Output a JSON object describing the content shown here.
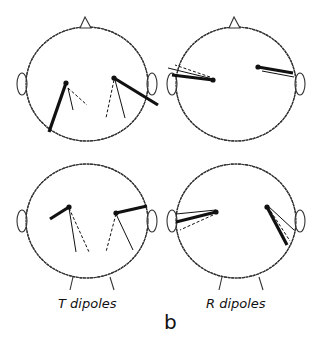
{
  "figure": {
    "panel_letter": "b",
    "columns": [
      {
        "label": "T dipoles"
      },
      {
        "label": "R dipoles"
      }
    ],
    "colors": {
      "ink": "#111111",
      "outline": "#333333"
    },
    "heads": [
      {
        "id": "top-left",
        "cx": 87,
        "cy": 84,
        "rx": 61,
        "ry": 57,
        "nose": true,
        "chin": false,
        "dipoles": [
          {
            "x1": 66,
            "y1": 83,
            "x2": 49,
            "y2": 132,
            "style": "thick"
          },
          {
            "x1": 68,
            "y1": 88,
            "x2": 73,
            "y2": 110,
            "style": "thin"
          },
          {
            "x1": 68,
            "y1": 88,
            "x2": 87,
            "y2": 105,
            "style": "dashed"
          },
          {
            "x1": 114,
            "y1": 78,
            "x2": 158,
            "y2": 105,
            "style": "thick"
          },
          {
            "x1": 115,
            "y1": 80,
            "x2": 125,
            "y2": 118,
            "style": "thin"
          },
          {
            "x1": 114,
            "y1": 80,
            "x2": 106,
            "y2": 118,
            "style": "dashed"
          }
        ]
      },
      {
        "id": "top-right",
        "cx": 236,
        "cy": 84,
        "rx": 60,
        "ry": 57,
        "nose": true,
        "chin": false,
        "dipoles": [
          {
            "x1": 213,
            "y1": 80,
            "x2": 172,
            "y2": 75,
            "style": "thick"
          },
          {
            "x1": 213,
            "y1": 79,
            "x2": 168,
            "y2": 68,
            "style": "thin"
          },
          {
            "x1": 210,
            "y1": 77,
            "x2": 175,
            "y2": 65,
            "style": "dashed"
          },
          {
            "x1": 258,
            "y1": 67,
            "x2": 293,
            "y2": 73,
            "style": "thick"
          },
          {
            "x1": 262,
            "y1": 71,
            "x2": 294,
            "y2": 77,
            "style": "thin"
          }
        ]
      },
      {
        "id": "bottom-left",
        "cx": 87,
        "cy": 221,
        "rx": 61,
        "ry": 57,
        "nose": false,
        "chin": true,
        "dipoles": [
          {
            "x1": 69,
            "y1": 207,
            "x2": 50,
            "y2": 219,
            "style": "thick"
          },
          {
            "x1": 69,
            "y1": 208,
            "x2": 76,
            "y2": 252,
            "style": "thin"
          },
          {
            "x1": 69,
            "y1": 208,
            "x2": 89,
            "y2": 252,
            "style": "dashed"
          },
          {
            "x1": 116,
            "y1": 213,
            "x2": 147,
            "y2": 206,
            "style": "thick"
          },
          {
            "x1": 116,
            "y1": 214,
            "x2": 133,
            "y2": 250,
            "style": "thin"
          },
          {
            "x1": 116,
            "y1": 214,
            "x2": 106,
            "y2": 252,
            "style": "dashed"
          }
        ]
      },
      {
        "id": "bottom-right",
        "cx": 236,
        "cy": 221,
        "rx": 60,
        "ry": 57,
        "nose": false,
        "chin": true,
        "dipoles": [
          {
            "x1": 216,
            "y1": 212,
            "x2": 176,
            "y2": 222,
            "style": "thick"
          },
          {
            "x1": 216,
            "y1": 210,
            "x2": 176,
            "y2": 214,
            "style": "thin"
          },
          {
            "x1": 213,
            "y1": 215,
            "x2": 180,
            "y2": 230,
            "style": "dashed"
          },
          {
            "x1": 267,
            "y1": 207,
            "x2": 287,
            "y2": 245,
            "style": "thick"
          },
          {
            "x1": 268,
            "y1": 206,
            "x2": 294,
            "y2": 230,
            "style": "thin"
          },
          {
            "x1": 268,
            "y1": 207,
            "x2": 290,
            "y2": 241,
            "style": "dashed"
          }
        ]
      }
    ]
  }
}
